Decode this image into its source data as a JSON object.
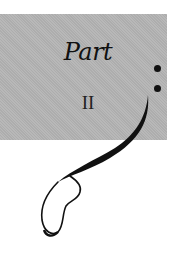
{
  "page": {
    "part_label": "Part",
    "part_number": "II"
  },
  "colors": {
    "panel": "#b4b4b4",
    "ink": "#111111",
    "background": "#ffffff"
  },
  "decoration": {
    "icons": [
      "dot-ornament",
      "dot-ornament",
      "calligraphic-swash"
    ]
  }
}
